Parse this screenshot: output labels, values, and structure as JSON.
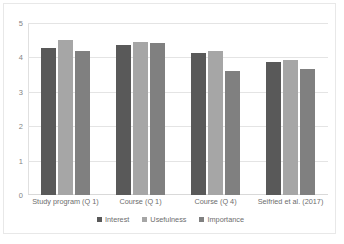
{
  "chart_data": {
    "type": "bar",
    "title": "",
    "subtitle": "",
    "xlabel": "",
    "ylabel": "",
    "ylim": [
      0,
      5
    ],
    "ytick_labels": [
      "5",
      "4",
      "3",
      "2",
      "1",
      "0"
    ],
    "ytick_values": [
      5,
      4,
      3,
      2,
      1,
      0
    ],
    "grid": true,
    "legend_position": "bottom",
    "categories": [
      "Study program (Q 1)",
      "Course (Q 1)",
      "Course (Q 4)",
      "Seifried et al. (2017)"
    ],
    "series": [
      {
        "name": "Interest",
        "color": "#595959",
        "values": [
          4.26,
          4.35,
          4.12,
          3.87
        ]
      },
      {
        "name": "Usefulness",
        "color": "#a6a6a6",
        "values": [
          4.51,
          4.45,
          4.18,
          3.92
        ]
      },
      {
        "name": "Importance",
        "color": "#808080",
        "values": [
          4.2,
          4.41,
          3.6,
          3.67
        ]
      }
    ]
  },
  "style": {
    "plot_background": "#ffffff",
    "frame_border": "#e8e8e8",
    "gridline_color": "#e4e4e4",
    "axis_color": "#d9d9d9",
    "tick_text_color": "#848484",
    "label_text_color": "#6d6d6d"
  }
}
